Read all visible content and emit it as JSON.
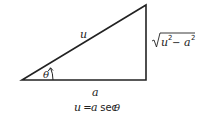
{
  "diagram": {
    "type": "right-triangle",
    "labels": {
      "hypotenuse": "u",
      "angle": "θ",
      "adjacent": "a",
      "opposite_radicand_u": "u",
      "opposite_sup_u": "2",
      "opposite_minus": " − ",
      "opposite_radicand_a": "a",
      "opposite_sup_a": "2",
      "caption_u": "u",
      "caption_eq": " = ",
      "caption_a": "a",
      "caption_sec": " sec ",
      "caption_theta": "θ"
    },
    "caption": "u = a sec θ",
    "opposite": "√(u² − a²)",
    "colors": {
      "stroke": "#222222",
      "background": "#ffffff"
    }
  }
}
